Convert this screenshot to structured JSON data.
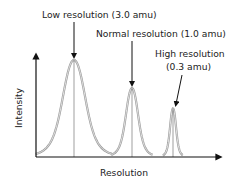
{
  "chart_data": {
    "type": "line",
    "title": "",
    "xlabel": "Resolution",
    "ylabel": "Intensity",
    "grid": false,
    "peaks": [
      {
        "name": "Low resolution",
        "width_amu": 3.0,
        "label_line1": "Low resolution (3.0 amu)",
        "label_line2": "",
        "relative_height": 1.0
      },
      {
        "name": "Normal resolution",
        "width_amu": 1.0,
        "label_line1": "Normal resolution (1.0 amu)",
        "label_line2": "",
        "relative_height": 0.71
      },
      {
        "name": "High resolution",
        "width_amu": 0.3,
        "label_line1": "High resolution",
        "label_line2": "(0.3 amu)",
        "relative_height": 0.5
      }
    ]
  },
  "colors": {
    "axis": "#111111",
    "peak": "#9a9a9a",
    "text": "#222222"
  }
}
